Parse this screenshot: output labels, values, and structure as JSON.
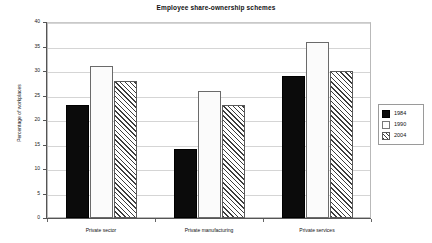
{
  "chart_data": {
    "type": "bar",
    "title": "Employee share-ownership schemes",
    "xlabel": "",
    "ylabel": "Percentage of workplaces",
    "categories": [
      "Private sector",
      "Private manufacturing",
      "Private services"
    ],
    "series": [
      {
        "name": "1984",
        "values": [
          23,
          14,
          29
        ],
        "fill": "solid-black-dotted",
        "color": "#0b0b0b"
      },
      {
        "name": "1990",
        "values": [
          31,
          26,
          36
        ],
        "fill": "white-dotted",
        "color": "#fbfbfb"
      },
      {
        "name": "2004",
        "values": [
          28,
          23,
          30
        ],
        "fill": "diagonal-hatch",
        "color": "#ffffff"
      }
    ],
    "ylim": [
      0,
      40
    ],
    "yticks": [
      0,
      5,
      10,
      15,
      20,
      25,
      30,
      35,
      40
    ],
    "ytick_labels": [
      "0",
      "5",
      "10",
      "15",
      "20",
      "25",
      "30",
      "35",
      "40"
    ],
    "grid": true,
    "grid_axis": "y",
    "legend_position": "right",
    "legend_entries": [
      "1984",
      "1990",
      "2004"
    ],
    "background": "#ffffff",
    "axis_color": "#555555",
    "grid_color": "#d5d5d5"
  }
}
